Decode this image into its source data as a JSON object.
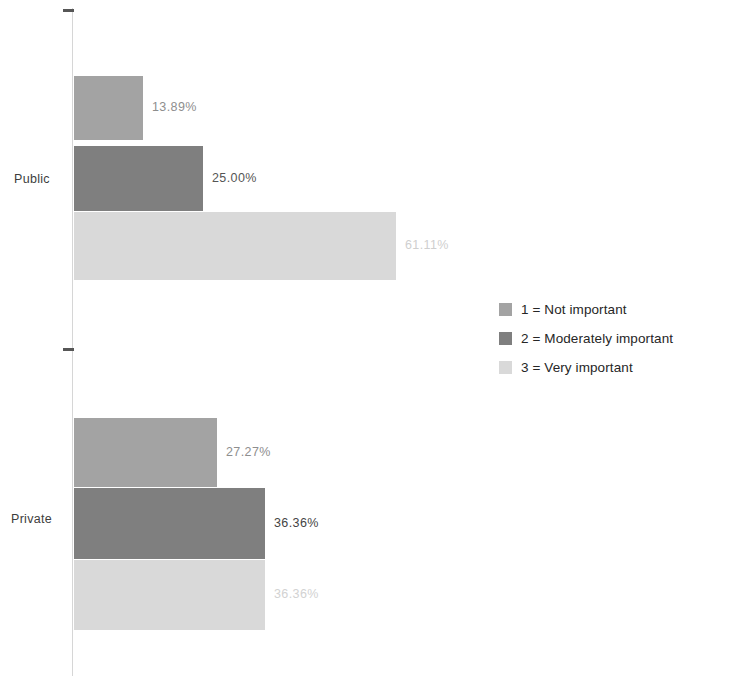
{
  "chart_data": {
    "type": "bar",
    "orientation": "horizontal",
    "title": "",
    "xlabel": "",
    "ylabel": "",
    "categories": [
      "Public",
      "Private"
    ],
    "grid": false,
    "axis": {
      "value_axis_ticks_shown": false,
      "category_axis_ticks": [
        "Public",
        "Private"
      ],
      "xlim": [
        0,
        61.11
      ]
    },
    "legend": {
      "position": "right",
      "entries": [
        {
          "label": "1 = Not important",
          "color": "#a3a3a3"
        },
        {
          "label": "2 = Moderately important",
          "color": "#7f7f7f"
        },
        {
          "label": "3 = Very important",
          "color": "#d9d9d9"
        }
      ]
    },
    "series": [
      {
        "name": "1 = Not important",
        "color": "#a3a3a3",
        "values": [
          13.89,
          27.27
        ],
        "labels": [
          "13.89%",
          "27.27%"
        ]
      },
      {
        "name": "2 = Moderately important",
        "color": "#7f7f7f",
        "values": [
          25.0,
          36.36
        ],
        "labels": [
          "25.00%",
          "36.36%"
        ]
      },
      {
        "name": "3 = Very important",
        "color": "#d9d9d9",
        "values": [
          61.11,
          36.36
        ],
        "labels": [
          "61.11%",
          "36.36%"
        ]
      }
    ],
    "bars": [
      {
        "group": "Public",
        "series": "1 = Not important",
        "value": 13.89,
        "label": "13.89%",
        "color": "#a3a3a3",
        "label_color": "#8e8e8e",
        "x": 74,
        "y": 76,
        "w": 69,
        "h": 64
      },
      {
        "group": "Public",
        "series": "2 = Moderately important",
        "value": 25.0,
        "label": "25.00%",
        "color": "#7f7f7f",
        "label_color": "#555555",
        "x": 74,
        "y": 146,
        "w": 129,
        "h": 65
      },
      {
        "group": "Public",
        "series": "3 = Very important",
        "value": 61.11,
        "label": "61.11%",
        "color": "#d9d9d9",
        "label_color": "#cfcfcf",
        "x": 74,
        "y": 212,
        "w": 322,
        "h": 68
      },
      {
        "group": "Private",
        "series": "1 = Not important",
        "value": 27.27,
        "label": "27.27%",
        "color": "#a3a3a3",
        "label_color": "#8e8e8e",
        "x": 74,
        "y": 418,
        "w": 143,
        "h": 69
      },
      {
        "group": "Private",
        "series": "2 = Moderately important",
        "value": 36.36,
        "label": "36.36%",
        "color": "#7f7f7f",
        "label_color": "#444444",
        "x": 74,
        "y": 488,
        "w": 191,
        "h": 71
      },
      {
        "group": "Private",
        "series": "3 = Very important",
        "value": 36.36,
        "label": "36.36%",
        "color": "#d9d9d9",
        "label_color": "#d2d2d2",
        "x": 74,
        "y": 560,
        "w": 191,
        "h": 70
      }
    ]
  }
}
